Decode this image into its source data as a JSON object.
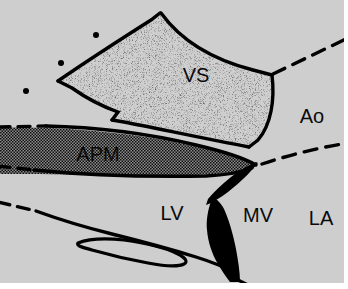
{
  "figure": {
    "width": 348,
    "height": 289,
    "background_color": "#c9c9c9",
    "line_color": "#000000",
    "paper_color": "#ffffff"
  },
  "labels": {
    "vs": "VS",
    "apm": "APM",
    "lv": "LV",
    "mv": "MV",
    "ao": "Ao",
    "la": "LA"
  },
  "regions": [
    {
      "id": "vs",
      "label": "VS",
      "fill_style": "fine-stipple",
      "label_x": 196,
      "label_y": 77,
      "font_size": 20
    },
    {
      "id": "apm",
      "label": "APM",
      "fill_style": "dark-checker",
      "label_x": 98,
      "label_y": 156,
      "font_size": 20
    },
    {
      "id": "lv",
      "label": "LV",
      "fill_style": "background-mottle",
      "label_x": 172,
      "label_y": 215,
      "font_size": 20
    },
    {
      "id": "mv",
      "label": "MV",
      "fill_style": "solid-black-leaflets",
      "label_x": 258,
      "label_y": 217,
      "font_size": 20
    },
    {
      "id": "ao",
      "label": "Ao",
      "fill_style": "background-mottle",
      "label_x": 312,
      "label_y": 118,
      "font_size": 20
    },
    {
      "id": "la",
      "label": "LA",
      "fill_style": "background-mottle",
      "label_x": 321,
      "label_y": 220,
      "font_size": 20
    }
  ],
  "markers": {
    "dots": [
      {
        "cx": 96,
        "cy": 35,
        "r": 3.0
      },
      {
        "cx": 61,
        "cy": 63,
        "r": 3.0
      },
      {
        "cx": 26,
        "cy": 91,
        "r": 3.0
      }
    ]
  }
}
